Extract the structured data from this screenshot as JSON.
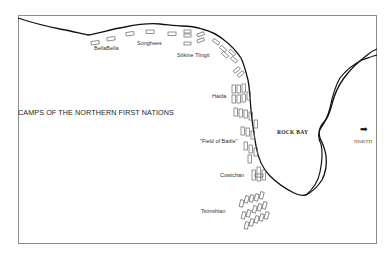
{
  "map": {
    "title": "CAMPS  OF THE NORTHERN FIRST NATIONS",
    "camps": [
      {
        "name": "BellaBella",
        "x": 94,
        "y": 40
      },
      {
        "name": "Songhees",
        "x": 137,
        "y": 38
      },
      {
        "name": "Stikine Tlingit",
        "x": 177,
        "y": 51
      },
      {
        "name": "Haida",
        "x": 212,
        "y": 94
      },
      {
        "name": "\"Field of Battle\"",
        "x": 201,
        "y": 139
      },
      {
        "name": "Cowichan",
        "x": 220,
        "y": 175
      },
      {
        "name": "Tsimshian",
        "x": 201,
        "y": 208
      }
    ],
    "places": {
      "bay": "ROCK BAY",
      "north_label": "NORTH",
      "north_arrow": "➡"
    },
    "colors": {
      "coastline": "#111111",
      "camp_outline": "#666666",
      "frame": "#8c8c8c",
      "background": "#ffffff"
    }
  }
}
